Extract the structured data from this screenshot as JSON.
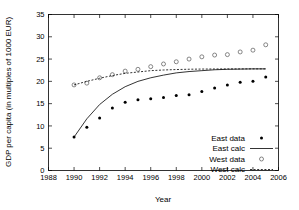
{
  "chart_data": {
    "type": "scatter",
    "title": "",
    "xlabel": "Year",
    "ylabel": "GDP per capita (in multiples of 1000 EUR)",
    "xlim": [
      1988,
      2006
    ],
    "ylim": [
      0,
      35
    ],
    "xticks": [
      1988,
      1990,
      1992,
      1994,
      1996,
      1998,
      2000,
      2002,
      2004,
      2006
    ],
    "yticks": [
      0,
      5,
      10,
      15,
      20,
      25,
      30,
      35
    ],
    "grid": false,
    "legend_position": "bottom-right",
    "series": [
      {
        "name": "East data",
        "style": "filled-circle",
        "x": [
          1990,
          1991,
          1992,
          1993,
          1994,
          1995,
          1996,
          1997,
          1998,
          1999,
          2000,
          2001,
          2002,
          2003,
          2004,
          2005
        ],
        "values": [
          7.5,
          9.7,
          11.8,
          14.0,
          15.3,
          15.9,
          16.1,
          16.4,
          16.8,
          17.0,
          17.7,
          18.5,
          19.2,
          19.8,
          20.0,
          21.0
        ]
      },
      {
        "name": "East calc",
        "style": "solid-line",
        "x": [
          1990,
          1991,
          1992,
          1993,
          1994,
          1995,
          1996,
          1997,
          1998,
          1999,
          2000,
          2001,
          2002,
          2003,
          2004,
          2005
        ],
        "values": [
          7.5,
          11.6,
          14.8,
          17.1,
          18.8,
          20.0,
          20.8,
          21.4,
          21.9,
          22.2,
          22.4,
          22.6,
          22.7,
          22.75,
          22.8,
          22.8
        ]
      },
      {
        "name": "West data",
        "style": "open-circle",
        "x": [
          1990,
          1991,
          1992,
          1993,
          1994,
          1995,
          1996,
          1997,
          1998,
          1999,
          2000,
          2001,
          2002,
          2003,
          2004,
          2005
        ],
        "values": [
          19.2,
          19.6,
          20.8,
          21.5,
          22.3,
          22.7,
          23.3,
          23.9,
          24.4,
          25.0,
          25.5,
          25.9,
          26.0,
          26.6,
          27.0,
          28.2
        ]
      },
      {
        "name": "West calc",
        "style": "dashed-line",
        "x": [
          1990,
          1991,
          1992,
          1993,
          1994,
          1995,
          1996,
          1997,
          1998,
          1999,
          2000,
          2001,
          2002,
          2003,
          2004,
          2005
        ],
        "values": [
          19.2,
          20.0,
          20.7,
          21.3,
          21.8,
          22.1,
          22.4,
          22.55,
          22.65,
          22.72,
          22.76,
          22.78,
          22.8,
          22.8,
          22.8,
          22.8
        ]
      }
    ],
    "legend": [
      {
        "label": "East data",
        "marker": "filled-circle"
      },
      {
        "label": "East calc",
        "marker": "solid-line"
      },
      {
        "label": "West data",
        "marker": "open-circle"
      },
      {
        "label": "West calc",
        "marker": "dashed-line"
      }
    ]
  },
  "colors": {
    "axis": "#000000",
    "background": "#ffffff",
    "east_marker": "#000000",
    "west_marker": "#555555"
  }
}
